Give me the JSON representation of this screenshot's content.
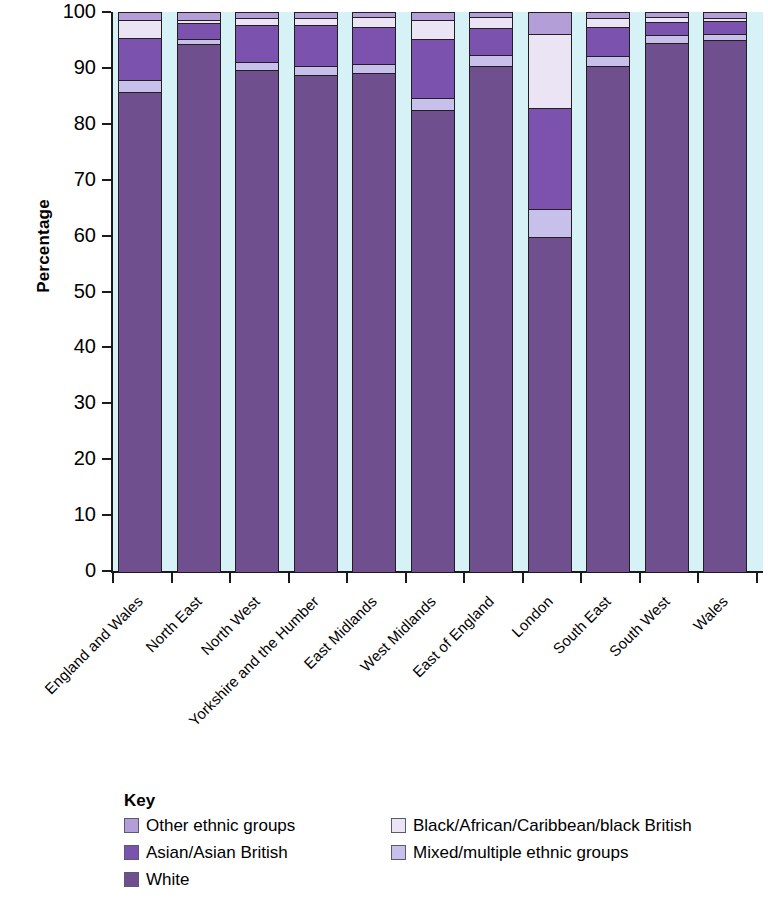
{
  "chart_data": {
    "type": "bar",
    "subtype": "stacked-percentage",
    "title": "",
    "xlabel": "",
    "ylabel": "Percentage",
    "ylim": [
      0,
      100
    ],
    "yticks": [
      0,
      10,
      20,
      30,
      40,
      50,
      60,
      70,
      80,
      90,
      100
    ],
    "grid": false,
    "legend_position": "below",
    "legend_title": "Key",
    "categories": [
      "England and Wales",
      "North East",
      "North West",
      "Yorkshire and the Humber",
      "East Midlands",
      "West Midlands",
      "East of England",
      "London",
      "South East",
      "South West",
      "Wales"
    ],
    "series": [
      {
        "name": "White",
        "color": "#6f4f8e",
        "values": [
          85.6,
          94.2,
          89.6,
          88.8,
          89.0,
          82.4,
          90.4,
          59.8,
          90.4,
          94.4,
          95.0
        ]
      },
      {
        "name": "Mixed/multiple ethnic groups",
        "color": "#c6c0ea",
        "values": [
          2.2,
          1.0,
          1.4,
          1.5,
          1.7,
          2.2,
          1.9,
          5.0,
          1.8,
          1.4,
          1.1
        ]
      },
      {
        "name": "Asian/Asian British",
        "color": "#7b52ae",
        "values": [
          7.5,
          2.9,
          6.6,
          7.4,
          6.6,
          10.6,
          4.8,
          18.0,
          5.2,
          2.4,
          2.3
        ]
      },
      {
        "name": "Black/African/Caribbean/black British",
        "color": "#ebe4f5",
        "values": [
          3.3,
          0.5,
          1.4,
          1.2,
          1.8,
          3.3,
          2.0,
          13.2,
          1.6,
          0.9,
          0.6
        ]
      },
      {
        "name": "Other ethnic groups",
        "color": "#b49ed8",
        "values": [
          1.4,
          1.4,
          1.0,
          1.1,
          0.9,
          1.5,
          0.9,
          4.0,
          1.0,
          0.9,
          1.0
        ]
      }
    ],
    "colors": {
      "plot_background": "#d6f2f7",
      "axis": "#1a1a1a",
      "bar_outline": "#231f20"
    }
  },
  "legend": {
    "title": "Key",
    "items": [
      {
        "label": "Other ethnic groups",
        "color": "#b49ed8"
      },
      {
        "label": "Black/African/Caribbean/black British",
        "color": "#ebe4f5"
      },
      {
        "label": "Asian/Asian British",
        "color": "#7b52ae"
      },
      {
        "label": "Mixed/multiple ethnic groups",
        "color": "#c6c0ea"
      },
      {
        "label": "White",
        "color": "#6f4f8e"
      }
    ]
  }
}
